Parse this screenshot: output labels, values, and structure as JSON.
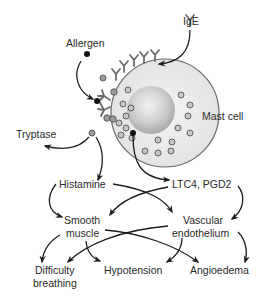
{
  "diagram": {
    "colors": {
      "cell_membrane": "#e4e4e4",
      "cell_outline": "#6a6a6a",
      "nucleus": "#c8c8c8",
      "granule": "#9a9a9a",
      "antibody": "#6c6c6c",
      "arrow": "#1e1e1e",
      "text": "#2a2a2a"
    },
    "labels": {
      "allergen": "Allergen",
      "ige": "IgE",
      "mast_cell": "Mast cell",
      "tryptase": "Tryptase",
      "histamine": "Histamine",
      "ltc4_pgd2": "LTC4, PGD2",
      "smooth_line1": "Smooth",
      "smooth_line2": "muscle",
      "vascular_line1": "Vascular",
      "vascular_line2": "endothelium",
      "difficulty_line1": "Difficulty",
      "difficulty_line2": "breathing",
      "hypotension": "Hypotension",
      "angioedema": "Angioedema"
    },
    "nodes": [
      {
        "id": "allergen",
        "label": "Allergen"
      },
      {
        "id": "ige",
        "label": "IgE"
      },
      {
        "id": "mast_cell",
        "label": "Mast cell"
      },
      {
        "id": "tryptase",
        "label": "Tryptase"
      },
      {
        "id": "histamine",
        "label": "Histamine"
      },
      {
        "id": "ltc4_pgd2",
        "label": "LTC4, PGD2"
      },
      {
        "id": "smooth_muscle",
        "label": "Smooth muscle"
      },
      {
        "id": "vascular_endothelium",
        "label": "Vascular endothelium"
      },
      {
        "id": "difficulty_breathing",
        "label": "Difficulty breathing"
      },
      {
        "id": "hypotension",
        "label": "Hypotension"
      },
      {
        "id": "angioedema",
        "label": "Angioedema"
      }
    ],
    "edges": [
      {
        "from": "allergen",
        "to": "mast_cell"
      },
      {
        "from": "ige",
        "to": "mast_cell"
      },
      {
        "from": "mast_cell",
        "to": "tryptase"
      },
      {
        "from": "mast_cell",
        "to": "histamine"
      },
      {
        "from": "mast_cell",
        "to": "ltc4_pgd2"
      },
      {
        "from": "histamine",
        "to": "smooth_muscle"
      },
      {
        "from": "histamine",
        "to": "vascular_endothelium"
      },
      {
        "from": "ltc4_pgd2",
        "to": "smooth_muscle"
      },
      {
        "from": "ltc4_pgd2",
        "to": "vascular_endothelium"
      },
      {
        "from": "smooth_muscle",
        "to": "difficulty_breathing"
      },
      {
        "from": "smooth_muscle",
        "to": "hypotension"
      },
      {
        "from": "smooth_muscle",
        "to": "angioedema"
      },
      {
        "from": "vascular_endothelium",
        "to": "difficulty_breathing"
      },
      {
        "from": "vascular_endothelium",
        "to": "hypotension"
      },
      {
        "from": "vascular_endothelium",
        "to": "angioedema"
      }
    ]
  }
}
